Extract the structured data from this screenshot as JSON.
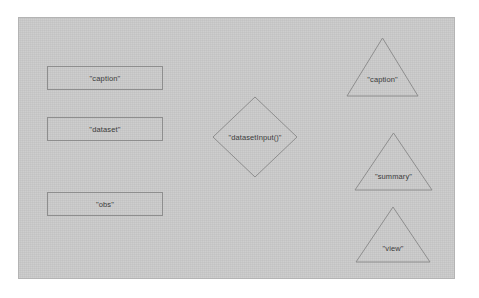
{
  "diagram": {
    "background_color": "#c9c9c9",
    "page_color": "#ffffff",
    "stroke_color": "#8e8e8e",
    "text_color": "#3b3b3b",
    "rectangles": [
      {
        "label": "\"caption\"",
        "x": 47,
        "y": 66,
        "width": 116,
        "height": 24
      },
      {
        "label": "\"dataset\"",
        "x": 47,
        "y": 117,
        "width": 116,
        "height": 24
      },
      {
        "label": "\"obs\"",
        "x": 47,
        "y": 192,
        "width": 116,
        "height": 24
      }
    ],
    "diamonds": [
      {
        "label": "\"datasetInput()\"",
        "x": 212,
        "y": 96,
        "width": 86,
        "height": 82
      }
    ],
    "triangles": [
      {
        "label": "\"caption\"",
        "x": 346,
        "y": 37,
        "width": 73,
        "height": 60
      },
      {
        "label": "\"summary\"",
        "x": 354,
        "y": 132,
        "width": 79,
        "height": 59
      },
      {
        "label": "\"view\"",
        "x": 355,
        "y": 206,
        "width": 76,
        "height": 57
      }
    ]
  }
}
